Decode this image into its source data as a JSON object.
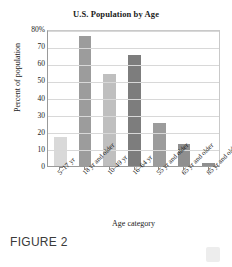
{
  "figure": {
    "caption": "FIGURE 2"
  },
  "chart_data": {
    "type": "bar",
    "title": "U.S. Population by Age",
    "xlabel": "Age category",
    "ylabel": "Percent of population",
    "ylim": [
      0,
      80
    ],
    "grid": true,
    "legend": "none",
    "categories": [
      "5–17 yr",
      "18 yr and older",
      "10–49 yr",
      "16–64 yr",
      "55 yr and older",
      "65 yr and older",
      "85 yr and older"
    ],
    "values": [
      17,
      76,
      54,
      65,
      25,
      13,
      2
    ],
    "bar_colors": [
      "#d9d9d9",
      "#9c9c9c",
      "#bfbfbf",
      "#7d7d7d",
      "#9c9c9c",
      "#8f8f8f",
      "#8f8f8f"
    ],
    "ytick_labels": [
      "80%",
      "70",
      "60",
      "50",
      "40",
      "30",
      "20",
      "10",
      "0"
    ],
    "ytick_values": [
      80,
      70,
      60,
      50,
      40,
      30,
      20,
      10,
      0
    ]
  }
}
